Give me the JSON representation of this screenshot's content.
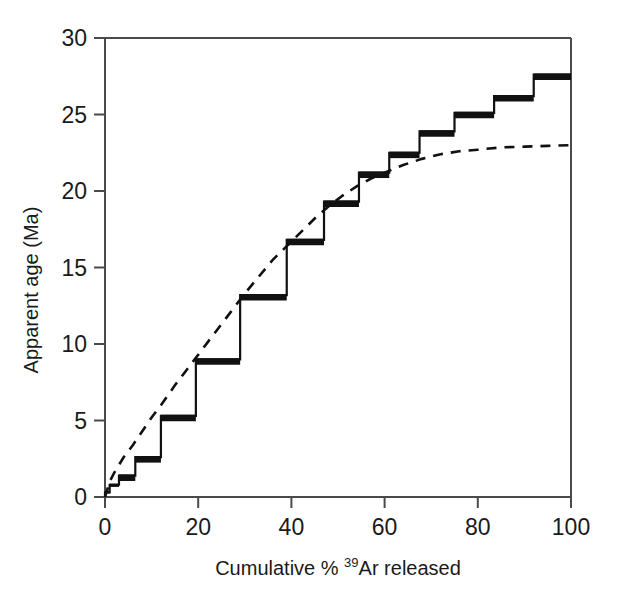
{
  "chart_data": {
    "type": "line",
    "title": "",
    "subtitle": "",
    "xlabel_parts": {
      "before": "Cumulative % ",
      "superscript": "39",
      "after": "Ar released"
    },
    "xlabel": "Cumulative % 39Ar released",
    "ylabel": "Apparent age (Ma)",
    "xlim": [
      0,
      100
    ],
    "ylim": [
      0,
      30
    ],
    "xticks": [
      0,
      20,
      40,
      60,
      80,
      100
    ],
    "yticks": [
      0,
      5,
      10,
      15,
      20,
      25,
      30
    ],
    "xtick_labels": [
      "0",
      "20",
      "40",
      "60",
      "80",
      "100"
    ],
    "ytick_labels": [
      "0",
      "5",
      "10",
      "15",
      "20",
      "25",
      "30"
    ],
    "grid": false,
    "legend": "none",
    "series": [
      {
        "name": "Measured age spectrum (step heating plateau)",
        "style": "step",
        "color": "#111111",
        "linewidth_thin": 2.2,
        "linewidth_thick": 6.5,
        "steps": [
          {
            "x_start": 0.0,
            "x_end": 1.0,
            "age": 0.3
          },
          {
            "x_start": 1.0,
            "x_end": 3.0,
            "age": 0.8
          },
          {
            "x_start": 3.0,
            "x_end": 6.5,
            "age": 1.4
          },
          {
            "x_start": 6.5,
            "x_end": 12.0,
            "age": 2.6
          },
          {
            "x_start": 12.0,
            "x_end": 19.5,
            "age": 5.3
          },
          {
            "x_start": 19.5,
            "x_end": 29.0,
            "age": 9.0
          },
          {
            "x_start": 29.0,
            "x_end": 39.0,
            "age": 13.2
          },
          {
            "x_start": 39.0,
            "x_end": 47.0,
            "age": 16.8
          },
          {
            "x_start": 47.0,
            "x_end": 54.5,
            "age": 19.3
          },
          {
            "x_start": 54.5,
            "x_end": 61.0,
            "age": 21.2
          },
          {
            "x_start": 61.0,
            "x_end": 67.5,
            "age": 22.5
          },
          {
            "x_start": 67.5,
            "x_end": 75.0,
            "age": 23.9
          },
          {
            "x_start": 75.0,
            "x_end": 83.5,
            "age": 25.1
          },
          {
            "x_start": 83.5,
            "x_end": 92.0,
            "age": 26.2
          },
          {
            "x_start": 92.0,
            "x_end": 100.0,
            "age": 27.6
          }
        ]
      },
      {
        "name": "Modelled diffusion profile",
        "style": "dashed",
        "color": "#111111",
        "linewidth": 2.6,
        "points": [
          {
            "x": 0.0,
            "y": 0.0
          },
          {
            "x": 1.0,
            "y": 1.0
          },
          {
            "x": 2.0,
            "y": 1.6
          },
          {
            "x": 4.0,
            "y": 2.6
          },
          {
            "x": 6.0,
            "y": 3.4
          },
          {
            "x": 8.0,
            "y": 4.3
          },
          {
            "x": 10.0,
            "y": 5.2
          },
          {
            "x": 12.0,
            "y": 6.0
          },
          {
            "x": 15.0,
            "y": 7.3
          },
          {
            "x": 18.0,
            "y": 8.5
          },
          {
            "x": 21.0,
            "y": 9.7
          },
          {
            "x": 24.0,
            "y": 10.9
          },
          {
            "x": 27.0,
            "y": 12.1
          },
          {
            "x": 30.0,
            "y": 13.3
          },
          {
            "x": 33.0,
            "y": 14.4
          },
          {
            "x": 36.0,
            "y": 15.5
          },
          {
            "x": 39.0,
            "y": 16.4
          },
          {
            "x": 42.0,
            "y": 17.3
          },
          {
            "x": 45.0,
            "y": 18.2
          },
          {
            "x": 48.0,
            "y": 19.0
          },
          {
            "x": 51.0,
            "y": 19.7
          },
          {
            "x": 54.0,
            "y": 20.3
          },
          {
            "x": 57.0,
            "y": 20.8
          },
          {
            "x": 60.0,
            "y": 21.2
          },
          {
            "x": 64.0,
            "y": 21.7
          },
          {
            "x": 68.0,
            "y": 22.1
          },
          {
            "x": 72.0,
            "y": 22.4
          },
          {
            "x": 76.0,
            "y": 22.6
          },
          {
            "x": 80.0,
            "y": 22.7
          },
          {
            "x": 85.0,
            "y": 22.85
          },
          {
            "x": 90.0,
            "y": 22.9
          },
          {
            "x": 95.0,
            "y": 22.95
          },
          {
            "x": 100.0,
            "y": 23.0
          }
        ]
      }
    ],
    "annotations": []
  },
  "colors": {
    "background": "#ffffff",
    "axis": "#4a4a4a",
    "data": "#111111",
    "text": "#1a1a1a"
  }
}
